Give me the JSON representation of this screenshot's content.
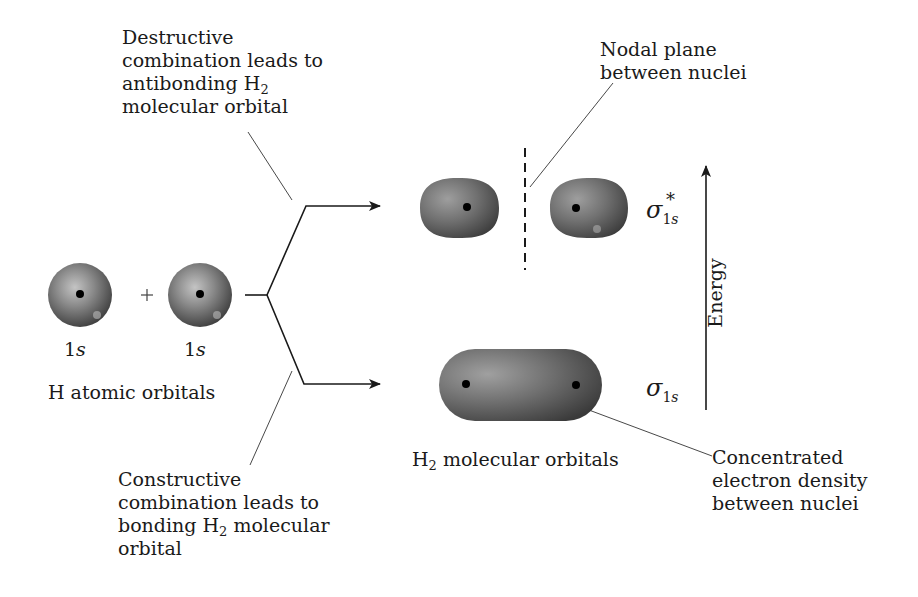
{
  "diagram": {
    "type": "molecular-orbital-formation",
    "annotations": {
      "destructive": {
        "line1": "Destructive",
        "line2": "combination leads to",
        "line3_prefix": "antibonding H",
        "line3_sub": "2",
        "line4": "molecular orbital"
      },
      "nodal_plane": {
        "line1": "Nodal plane",
        "line2": "between nuclei"
      },
      "constructive": {
        "line1": "Constructive",
        "line2": "combination leads to",
        "line3_prefix": "bonding H",
        "line3_sub": "2",
        "line3_suffix": " molecular",
        "line4": "orbital"
      },
      "concentrated": {
        "line1": "Concentrated",
        "line2": "electron density",
        "line3": "between nuclei"
      }
    },
    "atomic_orbitals": {
      "left_label_num": "1",
      "left_label_letter": "s",
      "right_label_num": "1",
      "right_label_letter": "s",
      "plus": "+",
      "caption": "H atomic orbitals"
    },
    "molecular_orbitals": {
      "caption_prefix": "H",
      "caption_sub": "2",
      "caption_suffix": " molecular orbitals",
      "antibonding": {
        "symbol": "σ",
        "subscript_num": "1",
        "subscript_letter": "s",
        "superscript": "*"
      },
      "bonding": {
        "symbol": "σ",
        "subscript_num": "1",
        "subscript_letter": "s"
      }
    },
    "axis": {
      "label": "Energy",
      "direction": "up"
    },
    "colors": {
      "orbital_dark": "#4a4a4a",
      "orbital_mid": "#7a7a7a",
      "orbital_light": "#b5b5b5",
      "nucleus": "#000000",
      "line": "#1a1a1a"
    }
  }
}
